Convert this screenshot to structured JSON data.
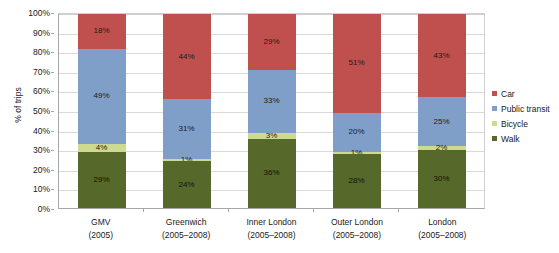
{
  "chart_data": {
    "type": "bar",
    "subtype": "stacked-100-percent",
    "title": "",
    "xlabel": "",
    "ylabel": "% of trips",
    "ylim": [
      0,
      100
    ],
    "ytick_labels": [
      "100%",
      "90%",
      "80%",
      "70%",
      "60%",
      "50%",
      "40%",
      "30%",
      "20%",
      "10%",
      "0%"
    ],
    "ytick_values": [
      100,
      90,
      80,
      70,
      60,
      50,
      40,
      30,
      20,
      10,
      0
    ],
    "grid": true,
    "legend_position": "right",
    "categories": [
      "GMV (2005)",
      "Greenwich (2005–2008)",
      "Inner London (2005–2008)",
      "Outer London (2005–2008)",
      "London (2005–2008)"
    ],
    "category_lines": [
      {
        "line1": "GMV",
        "line2": "(2005)"
      },
      {
        "line1": "Greenwich",
        "line2": "(2005–2008)"
      },
      {
        "line1": "Inner London",
        "line2": "(2005–2008)"
      },
      {
        "line1": "Outer London",
        "line2": "(2005–2008)"
      },
      {
        "line1": "London",
        "line2": "(2005–2008)"
      }
    ],
    "series": [
      {
        "name": "Car",
        "color": "#c0504d",
        "values": [
          18,
          44,
          29,
          51,
          43
        ],
        "labels": [
          "18%",
          "44%",
          "29%",
          "51%",
          "43%"
        ]
      },
      {
        "name": "Public transit",
        "color": "#7f9fc8",
        "values": [
          49,
          31,
          33,
          20,
          25
        ],
        "labels": [
          "49%",
          "31%",
          "33%",
          "20%",
          "25%"
        ]
      },
      {
        "name": "Bicycle",
        "color": "#cdda90",
        "values": [
          4,
          1,
          3,
          1,
          2
        ],
        "labels": [
          "4%",
          "1%",
          "3%",
          "1%",
          "2%"
        ]
      },
      {
        "name": "Walk",
        "color": "#56682a",
        "values": [
          29,
          24,
          36,
          28,
          30
        ],
        "labels": [
          "29%",
          "24%",
          "36%",
          "28%",
          "30%"
        ]
      }
    ]
  },
  "legend": {
    "items": [
      {
        "label": "Car",
        "color": "#c0504d"
      },
      {
        "label": "Public transit",
        "color": "#7f9fc8"
      },
      {
        "label": "Bicycle",
        "color": "#cdda90"
      },
      {
        "label": "Walk",
        "color": "#56682a"
      }
    ]
  }
}
